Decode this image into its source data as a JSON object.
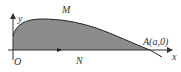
{
  "diagram": {
    "labels": {
      "y_axis": "y",
      "x_axis": "x",
      "origin": "O",
      "point_m": "M",
      "point_n": "N",
      "point_a": "A(a,0)"
    },
    "colors": {
      "fill": "#8c8c8c",
      "stroke": "#222222",
      "axis": "#333333",
      "text": "#333333"
    }
  }
}
